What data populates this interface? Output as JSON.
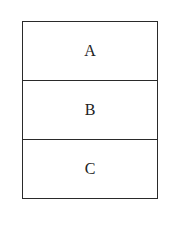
{
  "diagram": {
    "type": "stacked-boxes",
    "cells": [
      {
        "label": "A"
      },
      {
        "label": "B"
      },
      {
        "label": "C"
      }
    ],
    "colors": {
      "stroke": "#2a2a2a",
      "text": "#222222",
      "background": "#ffffff"
    }
  }
}
